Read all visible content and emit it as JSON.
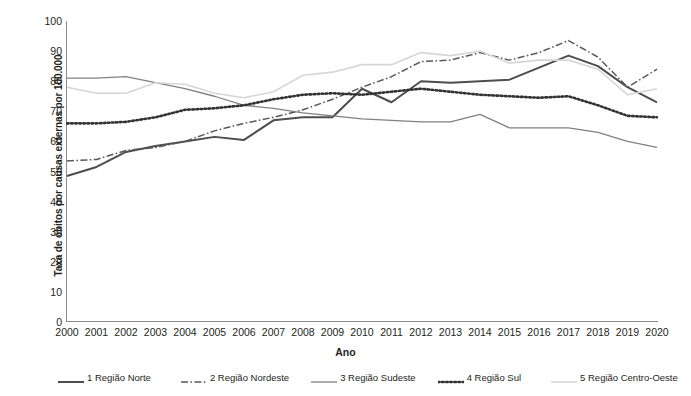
{
  "chart_data": {
    "type": "line",
    "title": "",
    "xlabel": "Ano",
    "ylabel": "Taxa de óbitos por causas externas por 100.000",
    "xlim": [
      2000,
      2020
    ],
    "ylim": [
      0,
      100
    ],
    "ytick_step": 10,
    "grid": false,
    "legend_position": "bottom",
    "categories": [
      "2000",
      "2001",
      "2002",
      "2003",
      "2004",
      "2005",
      "2006",
      "2007",
      "2008",
      "2009",
      "2010",
      "2011",
      "2012",
      "2013",
      "2014",
      "2015",
      "2016",
      "2017",
      "2018",
      "2019",
      "2020"
    ],
    "yticks": [
      "100",
      "90",
      "80",
      "70",
      "60",
      "50",
      "40",
      "30",
      "20",
      "10",
      "0"
    ],
    "series": [
      {
        "name": "1 Região Norte",
        "legend_label": "1 Região Norte",
        "color": "#4d4d4d",
        "style": "solid",
        "width": 2.0,
        "values": [
          48.5,
          51.5,
          56.5,
          58.5,
          60.0,
          61.5,
          60.5,
          67.0,
          68.0,
          68.0,
          77.5,
          73.0,
          80.0,
          79.5,
          80.0,
          80.5,
          84.5,
          88.5,
          85.0,
          78.0,
          73.0
        ]
      },
      {
        "name": "2 Região Nordeste",
        "legend_label": "2 Região Nordeste",
        "color": "#595959",
        "style": "dashdot",
        "width": 1.5,
        "values": [
          53.5,
          54.0,
          57.0,
          58.0,
          60.0,
          63.5,
          66.0,
          68.0,
          70.5,
          74.0,
          78.0,
          81.5,
          86.5,
          87.0,
          89.5,
          87.0,
          89.5,
          93.5,
          88.0,
          78.0,
          84.0
        ]
      },
      {
        "name": "3 Região Sudeste",
        "legend_label": "3 Região Sudeste",
        "color": "#808080",
        "style": "solid",
        "width": 1.3,
        "values": [
          81.0,
          81.0,
          81.5,
          79.5,
          77.5,
          75.0,
          72.0,
          71.0,
          69.5,
          68.5,
          67.5,
          67.0,
          66.5,
          66.5,
          69.0,
          64.5,
          64.5,
          64.5,
          63.0,
          60.0,
          58.0
        ]
      },
      {
        "name": "4 Região Sul",
        "legend_label": "4 Região Sul",
        "color": "#333333",
        "style": "dotted",
        "width": 2.6,
        "values": [
          66.0,
          66.0,
          66.5,
          68.0,
          70.5,
          71.0,
          72.0,
          74.0,
          75.5,
          76.0,
          75.5,
          76.5,
          77.5,
          76.5,
          75.5,
          75.0,
          74.5,
          75.0,
          72.0,
          68.5,
          68.0
        ]
      },
      {
        "name": "5 Região Centro-Oeste",
        "legend_label": "5 Região Centro-Oeste",
        "color": "#d6d6d6",
        "style": "solid",
        "width": 1.6,
        "values": [
          78.0,
          76.0,
          76.0,
          79.5,
          79.0,
          76.0,
          74.5,
          76.5,
          82.0,
          83.0,
          85.5,
          85.5,
          89.5,
          88.5,
          90.0,
          86.0,
          87.0,
          87.0,
          84.0,
          75.5,
          77.5
        ]
      }
    ]
  }
}
